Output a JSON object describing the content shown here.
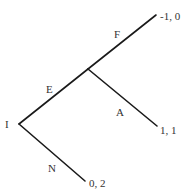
{
  "diagram": {
    "type": "game-tree",
    "nodes": {
      "root": {
        "label": "I",
        "x": 19,
        "y": 124
      },
      "branch": {
        "label": "",
        "x": 88,
        "y": 69
      }
    },
    "edges": [
      {
        "id": "E",
        "label": "E",
        "from": [
          19,
          124
        ],
        "to": [
          88,
          69
        ],
        "label_pos": [
          49,
          91
        ]
      },
      {
        "id": "N",
        "label": "N",
        "from": [
          19,
          124
        ],
        "to": [
          85,
          181
        ],
        "label_pos": [
          50,
          170
        ]
      },
      {
        "id": "F",
        "label": "F",
        "from": [
          88,
          69
        ],
        "to": [
          156,
          15
        ],
        "label_pos": [
          115,
          37
        ]
      },
      {
        "id": "A",
        "label": "A",
        "from": [
          88,
          69
        ],
        "to": [
          157,
          126
        ],
        "label_pos": [
          117,
          114
        ]
      }
    ],
    "payoffs": [
      {
        "id": "payoff-F",
        "text": "-1, 0",
        "pos": [
          160,
          19
        ]
      },
      {
        "id": "payoff-A",
        "text": "1, 1",
        "pos": [
          161,
          133
        ]
      },
      {
        "id": "payoff-N",
        "text": "0, 2",
        "pos": [
          89,
          186
        ]
      }
    ]
  }
}
